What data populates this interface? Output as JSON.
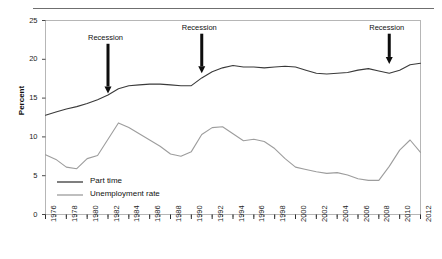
{
  "figure": {
    "header_rule": true,
    "ghost_header_text": ""
  },
  "chart_data": {
    "type": "line",
    "title": "",
    "xlabel": "",
    "ylabel": "Percent",
    "xlim": [
      1976,
      2012
    ],
    "ylim": [
      0,
      25
    ],
    "ytick_step": 5,
    "ytick_labels": [
      "0",
      "5",
      "10",
      "15",
      "20",
      "25"
    ],
    "ytick_values": [
      0,
      5,
      10,
      15,
      20,
      25
    ],
    "xtick_labels": [
      "1976",
      "1978",
      "1980",
      "1982",
      "1984",
      "1986",
      "1988",
      "1990",
      "1992",
      "1994",
      "1996",
      "1998",
      "2000",
      "2002",
      "2004",
      "2006",
      "2008",
      "2010",
      "2012"
    ],
    "xtick_values": [
      1976,
      1978,
      1980,
      1982,
      1984,
      1986,
      1988,
      1990,
      1992,
      1994,
      1996,
      1998,
      2000,
      2002,
      2004,
      2006,
      2008,
      2010,
      2012
    ],
    "minor_tick_interval": 1,
    "grid": false,
    "legend_position": "inside-lower-left",
    "x": [
      1976,
      1977,
      1978,
      1979,
      1980,
      1981,
      1982,
      1983,
      1984,
      1985,
      1986,
      1987,
      1988,
      1989,
      1990,
      1991,
      1992,
      1993,
      1994,
      1995,
      1996,
      1997,
      1998,
      1999,
      2000,
      2001,
      2002,
      2003,
      2004,
      2005,
      2006,
      2007,
      2008,
      2009,
      2010,
      2011,
      2012
    ],
    "series": [
      {
        "name": "Part time",
        "color": "#3a3a3a",
        "values": [
          12.8,
          13.2,
          13.6,
          13.9,
          14.3,
          14.8,
          15.4,
          16.2,
          16.6,
          16.7,
          16.8,
          16.8,
          16.7,
          16.6,
          16.6,
          17.6,
          18.4,
          18.9,
          19.2,
          19.0,
          19.0,
          18.9,
          19.0,
          19.1,
          19.0,
          18.6,
          18.2,
          18.1,
          18.2,
          18.3,
          18.6,
          18.8,
          18.5,
          18.2,
          18.6,
          19.3,
          19.5
        ]
      },
      {
        "name": "Unemployment rate",
        "color": "#9d9d9d",
        "values": [
          7.7,
          7.1,
          6.1,
          5.9,
          7.2,
          7.6,
          9.7,
          11.8,
          11.2,
          10.4,
          9.6,
          8.8,
          7.8,
          7.5,
          8.1,
          10.3,
          11.2,
          11.3,
          10.4,
          9.5,
          9.7,
          9.4,
          8.5,
          7.2,
          6.1,
          5.8,
          5.5,
          5.3,
          5.4,
          5.1,
          4.6,
          4.4,
          4.4,
          6.2,
          8.3,
          9.6,
          8.0
        ]
      }
    ],
    "annotations": [
      {
        "label": "Recession",
        "x": 1982,
        "arrow_from_y": 22.0,
        "arrow_to_y": 15.6
      },
      {
        "label": "Recession",
        "x": 1991,
        "arrow_from_y": 23.3,
        "arrow_to_y": 18.2
      },
      {
        "label": "Recession",
        "x": 2009,
        "arrow_from_y": 23.3,
        "arrow_to_y": 19.4
      }
    ]
  },
  "legend": {
    "items": [
      {
        "label": "Part time",
        "color": "#3a3a3a"
      },
      {
        "label": "Unemployment rate",
        "color": "#9d9d9d"
      }
    ]
  }
}
